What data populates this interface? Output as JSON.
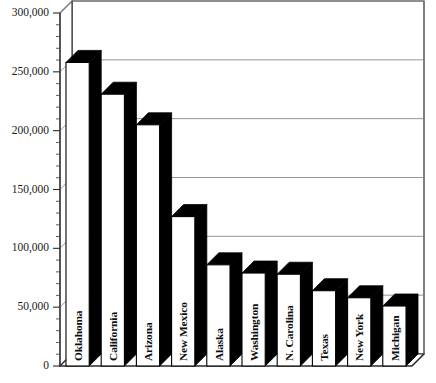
{
  "chart_data": {
    "type": "bar",
    "title": "",
    "subtitle": "",
    "xlabel": "",
    "ylabel": "",
    "orientation": "vertical",
    "style": "3d-bar",
    "grid": true,
    "legend": "none",
    "ylim": [
      0,
      300000
    ],
    "ytick_step": 50000,
    "yminor_step": 10000,
    "ytick_labels": [
      "300,000",
      "250,000",
      "200,000",
      "150,000",
      "100,000",
      "50,000",
      "0"
    ],
    "ytick_values": [
      300000,
      250000,
      200000,
      150000,
      100000,
      50000,
      0
    ],
    "categories": [
      "Oklahoma",
      "California",
      "Arizona",
      "New Mexico",
      "Alaska",
      "Washington",
      "N. Carolina",
      "Texas",
      "New York",
      "Michigan"
    ],
    "values": [
      258000,
      231000,
      205000,
      127000,
      86000,
      79000,
      78000,
      64000,
      58000,
      51000
    ],
    "colors": {
      "bar_front": "#ffffff",
      "bar_side": "#000000",
      "bar_top": "#000000",
      "axis": "#2b2b2b",
      "grid": "#8a8a8a",
      "background": "#ffffff",
      "text": "#0d0d0d"
    }
  }
}
